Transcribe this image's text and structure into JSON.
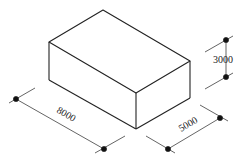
{
  "diagram": {
    "type": "isometric box with dimensions",
    "dimensions": {
      "length": "8000",
      "width": "5000",
      "height": "3000"
    }
  }
}
